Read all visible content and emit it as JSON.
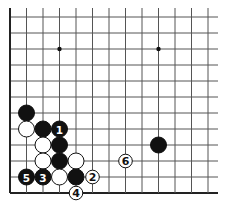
{
  "diagram": {
    "type": "go-board-fragment",
    "grid": {
      "cols": 13,
      "rows": 12,
      "origin_x": 10,
      "origin_y": 17,
      "spacing_x": 16.5,
      "spacing_y": 16,
      "left_edge": true,
      "bottom_edge": true,
      "top_open": true,
      "right_open": true
    },
    "star_points": [
      {
        "col": 3,
        "row": 2
      },
      {
        "col": 9,
        "row": 2
      }
    ],
    "stones": [
      {
        "col": 1,
        "row": 6,
        "color": "black",
        "label": ""
      },
      {
        "col": 1,
        "row": 7,
        "color": "white",
        "label": ""
      },
      {
        "col": 2,
        "row": 7,
        "color": "black",
        "label": ""
      },
      {
        "col": 3,
        "row": 7,
        "color": "black",
        "label": "1"
      },
      {
        "col": 2,
        "row": 8,
        "color": "white",
        "label": ""
      },
      {
        "col": 3,
        "row": 8,
        "color": "black",
        "label": ""
      },
      {
        "col": 9,
        "row": 8,
        "color": "black",
        "label": ""
      },
      {
        "col": 2,
        "row": 9,
        "color": "white",
        "label": ""
      },
      {
        "col": 3,
        "row": 9,
        "color": "black",
        "label": ""
      },
      {
        "col": 4,
        "row": 9,
        "color": "white",
        "label": ""
      },
      {
        "col": 7,
        "row": 9,
        "color": "white",
        "label": "6",
        "small": true
      },
      {
        "col": 1,
        "row": 10,
        "color": "black",
        "label": "5"
      },
      {
        "col": 2,
        "row": 10,
        "color": "black",
        "label": "3"
      },
      {
        "col": 3,
        "row": 10,
        "color": "white",
        "label": ""
      },
      {
        "col": 4,
        "row": 10,
        "color": "black",
        "label": ""
      },
      {
        "col": 5,
        "row": 10,
        "color": "white",
        "label": "2",
        "small": true
      },
      {
        "col": 4,
        "row": 11,
        "color": "white",
        "label": "4",
        "small": true
      }
    ],
    "colors": {
      "line": "#555555",
      "edge": "#222222",
      "black_stone": "#111111",
      "white_stone": "#ffffff"
    }
  }
}
